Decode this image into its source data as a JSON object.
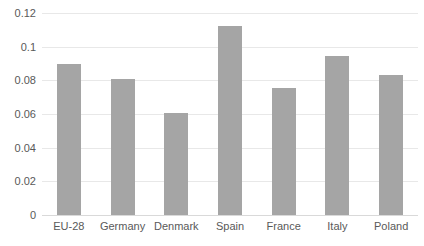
{
  "chart_data": {
    "type": "bar",
    "title": "",
    "subtitle": "",
    "xlabel": "",
    "ylabel": "",
    "categories": [
      "EU-28",
      "Germany",
      "Denmark",
      "Spain",
      "France",
      "Italy",
      "Poland"
    ],
    "values": [
      0.09,
      0.0805,
      0.0605,
      0.112,
      0.0753,
      0.0943,
      0.0832
    ],
    "series": [
      {
        "name": "Series 1",
        "values": [
          0.09,
          0.0805,
          0.0605,
          0.112,
          0.0753,
          0.0943,
          0.0832
        ]
      }
    ],
    "ylim": [
      0,
      0.12
    ],
    "y_ticks": [
      0,
      0.02,
      0.04,
      0.06,
      0.08,
      0.1,
      0.12
    ],
    "y_tick_labels": [
      "0",
      "0.02",
      "0.04",
      "0.06",
      "0.08",
      "0.1",
      "0.12"
    ],
    "grid": "horizontal",
    "legend": "none",
    "bar_color": "#a5a5a5",
    "gridline_color": "#e8e8e8",
    "axis_text_color": "#595959",
    "background": "#ffffff",
    "annotations": []
  }
}
